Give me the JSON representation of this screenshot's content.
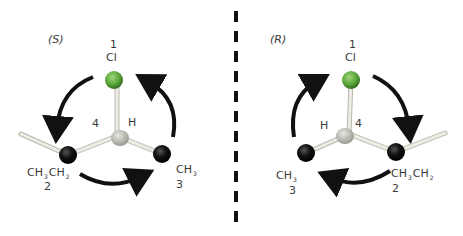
{
  "left": {
    "config_label": "(S)",
    "priority_1": {
      "rank": "1",
      "group": "Cl"
    },
    "priority_2": {
      "rank": "2",
      "group_parts": [
        "CH",
        "3",
        "CH",
        "2"
      ]
    },
    "priority_3": {
      "rank": "3",
      "group_parts": [
        "CH",
        "3"
      ]
    },
    "priority_4": {
      "rank": "4",
      "group": "H"
    },
    "rotation": "counterclockwise"
  },
  "right": {
    "config_label": "(R)",
    "priority_1": {
      "rank": "1",
      "group": "Cl"
    },
    "priority_2": {
      "rank": "2",
      "group_parts": [
        "CH",
        "3",
        "CH",
        "2"
      ]
    },
    "priority_3": {
      "rank": "3",
      "group_parts": [
        "CH",
        "3"
      ]
    },
    "priority_4": {
      "rank": "4",
      "group": "H"
    },
    "rotation": "clockwise"
  },
  "colors": {
    "chlorine": "#5aa83a",
    "carbon": "#111111",
    "hydrogen": "#bdbdb5",
    "bond": "#e0e0d8",
    "arrow": "#111111",
    "divider": "#111111"
  }
}
